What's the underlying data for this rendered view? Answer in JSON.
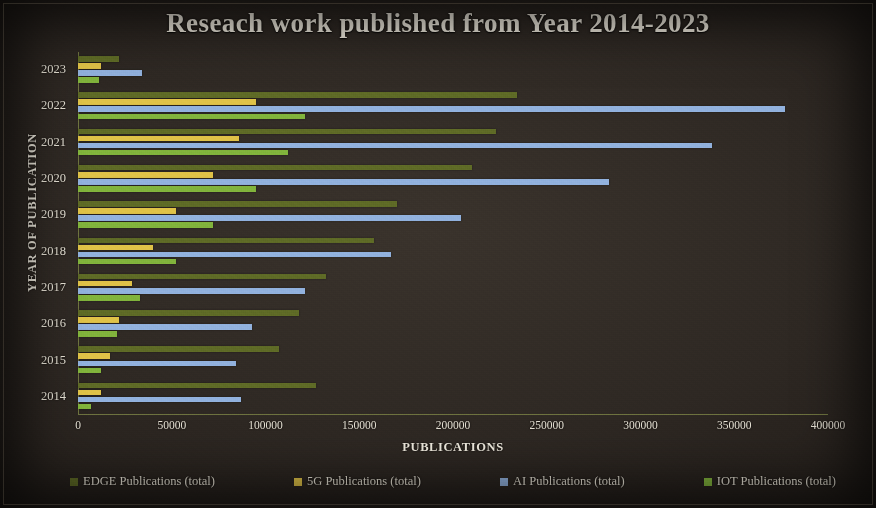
{
  "chart_data": {
    "type": "bar",
    "orientation": "horizontal",
    "title": "Reseach work published from Year 2014-2023",
    "xlabel": "PUBLICATIONS",
    "ylabel": "YEAR OF PUBLICATION",
    "categories": [
      "2014",
      "2015",
      "2016",
      "2017",
      "2018",
      "2019",
      "2020",
      "2021",
      "2022",
      "2023"
    ],
    "xticks": [
      0,
      50000,
      100000,
      150000,
      200000,
      250000,
      300000,
      350000,
      400000
    ],
    "xtick_labels": [
      "0",
      "50000",
      "100000",
      "150000",
      "200000",
      "250000",
      "300000",
      "350000",
      "400000"
    ],
    "xlim": [
      0,
      400000
    ],
    "grid": false,
    "legend_position": "bottom",
    "series": [
      {
        "name": "EDGE Publications (total)",
        "color": "#5f6b26",
        "values": [
          127000,
          107000,
          118000,
          132000,
          158000,
          170000,
          210000,
          223000,
          234000,
          22000
        ]
      },
      {
        "name": "5G Publications (total)",
        "color": "#e0c348",
        "values": [
          12000,
          17000,
          22000,
          29000,
          40000,
          52000,
          72000,
          86000,
          95000,
          12000
        ]
      },
      {
        "name": "AI Publications (total)",
        "color": "#92b2de",
        "values": [
          87000,
          84000,
          93000,
          121000,
          167000,
          204000,
          283000,
          338000,
          377000,
          34000
        ]
      },
      {
        "name": "IOT Publications (total)",
        "color": "#82b43c",
        "values": [
          7000,
          12000,
          21000,
          33000,
          52000,
          72000,
          95000,
          112000,
          121000,
          11000
        ]
      }
    ]
  }
}
